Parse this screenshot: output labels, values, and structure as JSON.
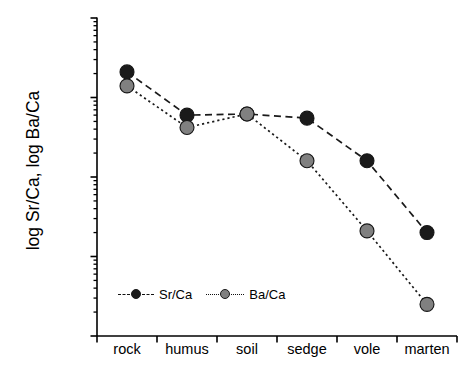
{
  "chart_data": {
    "type": "line",
    "title": "",
    "xlabel": "",
    "ylabel": "log Sr/Ca, log Ba/Ca",
    "categories": [
      "rock",
      "humus",
      "soil",
      "sedge",
      "vole",
      "marten"
    ],
    "yscale": "log",
    "ylim": [
      1e-05,
      0.1
    ],
    "ytick_labels": [
      "0.1",
      "0.01",
      "0.001",
      "0.0001",
      "0.00001"
    ],
    "ytick_values": [
      0.1,
      0.01,
      0.001,
      0.0001,
      1e-05
    ],
    "grid": false,
    "legend_position": "inside-bottom-left",
    "series": [
      {
        "name": "Sr/Ca",
        "color": "#1a1a1a",
        "marker": "filled-circle",
        "linestyle": "dashed",
        "values": [
          0.021,
          0.006,
          0.0062,
          0.0055,
          0.0016,
          0.0002
        ]
      },
      {
        "name": "Ba/Ca",
        "color": "#808080",
        "marker": "filled-circle",
        "linestyle": "dotted",
        "values": [
          0.014,
          0.0042,
          0.0062,
          0.0016,
          0.00021,
          2.5e-05
        ]
      }
    ]
  },
  "axes": {
    "y_title": "log Sr/Ca, log Ba/Ca"
  },
  "legend": {
    "entries": [
      {
        "label": "Sr/Ca"
      },
      {
        "label": "Ba/Ca"
      }
    ]
  },
  "colors": {
    "series_sr": "#1a1a1a",
    "series_ba": "#808080",
    "axis": "#000000",
    "background": "#ffffff"
  }
}
